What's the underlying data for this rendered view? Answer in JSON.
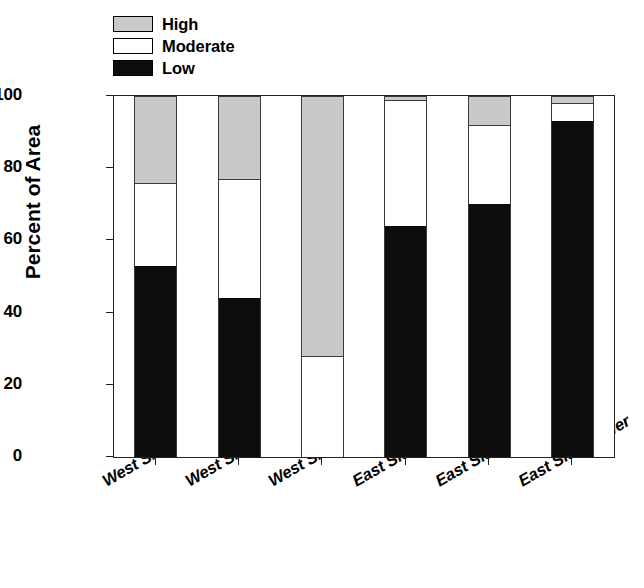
{
  "legend": {
    "position": "top-left",
    "items": [
      {
        "label": "High",
        "color": "#c9c9c9"
      },
      {
        "label": "Moderate",
        "color": "#ffffff"
      },
      {
        "label": "Low",
        "color": "#0d0d0d"
      }
    ]
  },
  "axes": {
    "ylabel": "Percent of Area",
    "xlabel": "",
    "yticks": [
      0,
      20,
      40,
      60,
      80,
      100
    ],
    "ytick_labels": [
      "0",
      "20",
      "40",
      "60",
      "80",
      "100"
    ],
    "ylim": [
      0,
      100
    ],
    "grid": false
  },
  "chart_data": {
    "type": "bar",
    "title": "",
    "xlabel": "",
    "ylabel": "Percent of Area",
    "ylim": [
      0,
      100
    ],
    "grid": false,
    "stacked": true,
    "legend_position": "top-left",
    "categories": [
      "West Side-Lower",
      "West Side-Middle",
      "West Side-Upper",
      "East Side-Upper",
      "East Side-Middle",
      "East Side-Lower"
    ],
    "series": [
      {
        "name": "Low",
        "color": "#0d0d0d",
        "values": [
          53,
          44,
          0,
          64,
          70,
          93
        ]
      },
      {
        "name": "Moderate",
        "color": "#ffffff",
        "values": [
          23,
          33,
          28,
          35,
          22,
          5
        ]
      },
      {
        "name": "High",
        "color": "#c9c9c9",
        "values": [
          24,
          23,
          72,
          1,
          8,
          2
        ]
      }
    ]
  }
}
